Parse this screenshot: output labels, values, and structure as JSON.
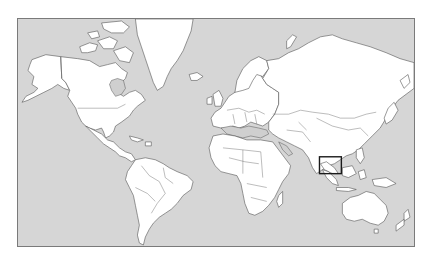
{
  "map": {
    "projection": "mercator",
    "colors": {
      "ocean": "#d6d6d6",
      "land": "#ffffff",
      "borders": "#555555",
      "inland_sea": "#cfcfcf",
      "highlight": "#1a1a1a"
    },
    "highlight_box": {
      "region": "Sumatra / Malay Peninsula (Southeast Asia)",
      "x": 320,
      "y": 157,
      "width": 22,
      "height": 17
    },
    "visible_regions": [
      "North America",
      "Greenland",
      "South America",
      "Europe",
      "Africa",
      "Asia",
      "Southeast Asia",
      "Australia",
      "New Zealand"
    ]
  }
}
